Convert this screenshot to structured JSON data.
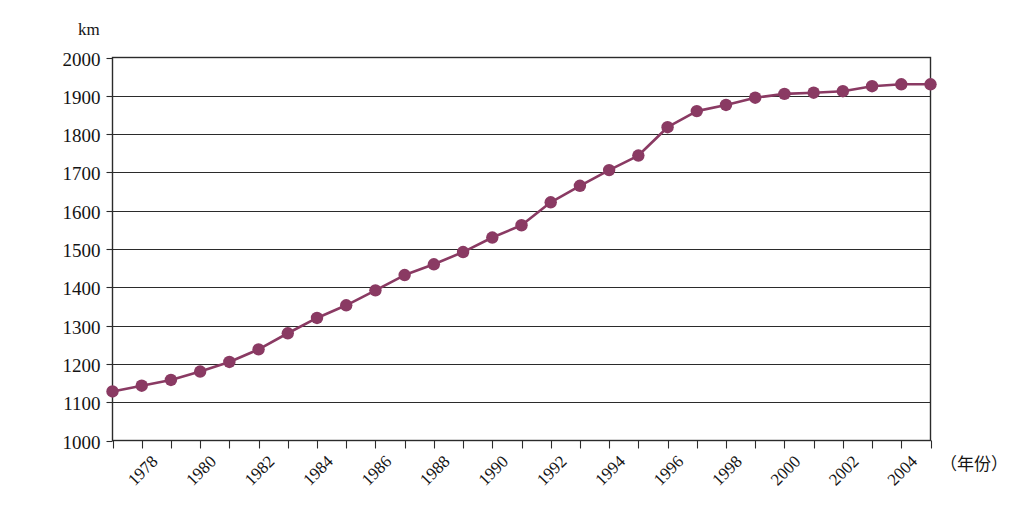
{
  "chart_data": {
    "type": "line",
    "title": "",
    "subtitle": "",
    "xlabel": "（年份）",
    "ylabel": "km",
    "unit_label": "km",
    "ylim": [
      1000,
      2000
    ],
    "ytick_step": 100,
    "yticks": [
      2000,
      1900,
      1800,
      1700,
      1600,
      1500,
      1400,
      1300,
      1200,
      1100,
      1000
    ],
    "xlim": [
      1977,
      2005
    ],
    "xticks_labeled": [
      "1978",
      "1980",
      "1982",
      "1984",
      "1986",
      "1988",
      "1990",
      "1992",
      "1994",
      "1996",
      "1998",
      "2000",
      "2002",
      "2004"
    ],
    "xtick_label_rotation_deg": -45,
    "grid": "horizontal",
    "legend": "none",
    "series_color": "#8a3a63",
    "marker_color": "#8a3a63",
    "marker_shape": "circle",
    "x": [
      1977,
      1978,
      1979,
      1980,
      1981,
      1982,
      1983,
      1984,
      1985,
      1986,
      1987,
      1988,
      1989,
      1990,
      1991,
      1992,
      1993,
      1994,
      1995,
      1996,
      1997,
      1998,
      1999,
      2000,
      2001,
      2002,
      2003,
      2004,
      2005
    ],
    "values": [
      1128,
      1143,
      1158,
      1180,
      1205,
      1238,
      1280,
      1320,
      1353,
      1392,
      1432,
      1460,
      1492,
      1530,
      1562,
      1622,
      1665,
      1706,
      1744,
      1818,
      1860,
      1876,
      1895,
      1905,
      1908,
      1912,
      1925,
      1930,
      1930
    ],
    "series": [
      {
        "name": "",
        "values": [
          1128,
          1143,
          1158,
          1180,
          1205,
          1238,
          1280,
          1320,
          1353,
          1392,
          1432,
          1460,
          1492,
          1530,
          1562,
          1622,
          1665,
          1706,
          1744,
          1818,
          1860,
          1876,
          1895,
          1905,
          1908,
          1912,
          1925,
          1930,
          1930
        ]
      }
    ],
    "annotations": []
  },
  "axes": {
    "y_unit": "km",
    "x_title": "（年份）"
  }
}
